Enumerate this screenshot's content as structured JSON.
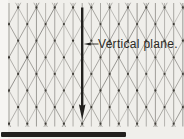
{
  "figure": {
    "type": "isometric-sketching-paper-diagram",
    "label": {
      "text": "Vertical plane."
    },
    "colors": {
      "background": "#f0efeb",
      "margin": "#f6f5f2",
      "grid_line": "#615f5a",
      "grid_dot": "#37352f",
      "arrow": "#22211e",
      "label_text": "#2b2a26",
      "bottom_bar": "#21201d"
    }
  }
}
